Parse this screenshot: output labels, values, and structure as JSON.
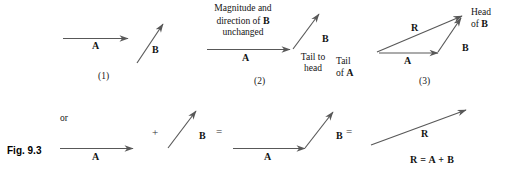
{
  "figure": {
    "caption": "Fig. 9.3",
    "stroke_color": "#585858",
    "text_color": "#141414"
  },
  "panels": [
    {
      "id": "panel-1",
      "number": "(1)",
      "vector_a_label": "A",
      "vector_b_label": "B"
    },
    {
      "id": "panel-2",
      "number": "(2)",
      "note": "Magnitude and direction of B unchanged",
      "note_line1": "Magnitude and",
      "note_line2_pre": "direction of ",
      "note_line2_vec": "B",
      "note_line3": "unchanged",
      "vector_a_label": "A",
      "vector_b_label": "B",
      "tail_to_head_line1": "Tail to",
      "tail_to_head_line2": "head"
    },
    {
      "id": "panel-3",
      "number": "(3)",
      "vector_a_label": "A",
      "vector_b_label": "B",
      "resultant_label": "R",
      "tail_of_a_line1": "Tail",
      "tail_of_a_line2_pre": "of ",
      "tail_of_a_line2_vec": "A",
      "head_of_b_line1": "Head",
      "head_of_b_line2_pre": "of ",
      "head_of_b_line2_vec": "B"
    }
  ],
  "bottom_row": {
    "or_label": "or",
    "plus_operator": "+",
    "equals_operator_1": "=",
    "equals_operator_2": "=",
    "vector_a_label_1": "A",
    "vector_b_label_1": "B",
    "vector_a_label_2": "A",
    "vector_b_label_2": "B",
    "resultant_label": "R",
    "equation": "R = A + B"
  }
}
